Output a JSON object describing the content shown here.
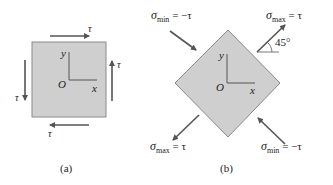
{
  "colors": {
    "element_fill": "#cfcfcf",
    "element_stroke": "#8a8a8a",
    "arrow": "#555555",
    "text": "#222222"
  },
  "panel_a": {
    "caption": "(a)",
    "stress_label": "τ",
    "axis_x": "x",
    "axis_y": "y",
    "origin": "O"
  },
  "panel_b": {
    "caption": "(b)",
    "axis_x": "x",
    "axis_y": "y",
    "origin": "O",
    "angle": "45°",
    "sigma_symbol": "σ",
    "top_left": {
      "sub": "min",
      "rhs": " = −τ"
    },
    "top_right": {
      "sub": "max",
      "rhs": " = τ"
    },
    "bottom_left": {
      "sub": "max",
      "rhs": " = τ"
    },
    "bottom_right": {
      "sub": "min",
      "rhs": " = −τ"
    }
  }
}
